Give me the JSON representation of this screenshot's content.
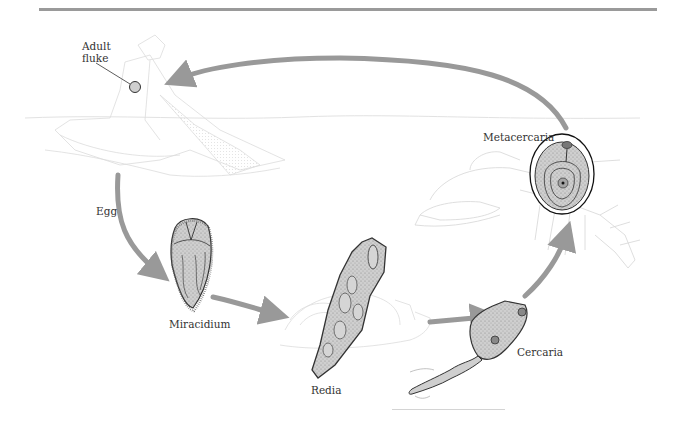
{
  "diagram": {
    "colors": {
      "arrow": "#999999",
      "top_rule": "#9a9a9a",
      "background_sketch": "#d8d8d8",
      "organism_fill": "#c8c8c8",
      "organism_outline": "#333333"
    },
    "stages": [
      {
        "id": "adult-fluke",
        "label": "Adult fluke",
        "label_lines": [
          "Adult",
          "fluke"
        ]
      },
      {
        "id": "egg",
        "label": "Egg"
      },
      {
        "id": "miracidium",
        "label": "Miracidium"
      },
      {
        "id": "redia",
        "label": "Redia"
      },
      {
        "id": "cercaria",
        "label": "Cercaria"
      },
      {
        "id": "metacercaria",
        "label": "Metacercaria"
      }
    ],
    "flow": [
      {
        "from": "adult-fluke",
        "to": "egg"
      },
      {
        "from": "egg",
        "to": "miracidium"
      },
      {
        "from": "miracidium",
        "to": "redia"
      },
      {
        "from": "redia",
        "to": "cercaria"
      },
      {
        "from": "cercaria",
        "to": "metacercaria"
      },
      {
        "from": "metacercaria",
        "to": "adult-fluke"
      }
    ],
    "background_hosts": [
      "human-host-sketch",
      "snail-host-sketch",
      "crayfish-host-sketch",
      "water-surface-line"
    ]
  }
}
